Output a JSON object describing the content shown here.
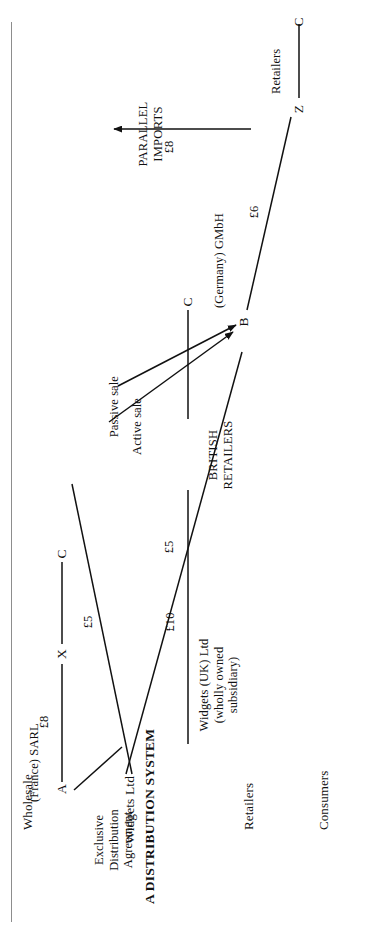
{
  "figure": {
    "title": "A DISTRIBUTION SYSTEM",
    "tiers": [
      {
        "id": "wholesale",
        "label": "Wholesale"
      },
      {
        "id": "retailers",
        "label": "Retailers"
      },
      {
        "id": "consumers",
        "label": "Consumers"
      }
    ],
    "nodes": [
      {
        "id": "A",
        "label": "A",
        "company": "(France) SARL",
        "tier": "wholesale"
      },
      {
        "id": "B",
        "label": "B",
        "company": "(Germany) GMbH",
        "tier": "wholesale"
      },
      {
        "id": "W",
        "label": "Widgets Ltd",
        "tier": "wholesale"
      },
      {
        "id": "X",
        "label": "X",
        "tier": "retailers"
      },
      {
        "id": "Z",
        "label": "Z",
        "company": "Retailers",
        "tier": "retailers"
      },
      {
        "id": "UK",
        "label": "Widgets (UK) Ltd\n(wholly owned\nsubsidiary)",
        "tier": "retailers"
      },
      {
        "id": "BR",
        "label": "BRITISH\nRETAILERS",
        "tier": "retailers"
      },
      {
        "id": "CA",
        "label": "C",
        "tier": "consumers"
      },
      {
        "id": "CB",
        "label": "C",
        "tier": "consumers"
      },
      {
        "id": "CC",
        "label": "C",
        "tier": "consumers"
      }
    ],
    "annotations": [
      {
        "id": "exclusive-agreement",
        "text": "Exclusive\nDistribution\nAgreement"
      },
      {
        "id": "passive-sale",
        "text": "Passive sale"
      },
      {
        "id": "active-sale",
        "text": "Active sale"
      },
      {
        "id": "parallel-imports",
        "text": "PARALLEL\nIMPORTS"
      }
    ],
    "prices": [
      {
        "id": "price-w-a",
        "text": "£5",
        "from": "Widgets Ltd",
        "to": "A (France) SARL"
      },
      {
        "id": "price-w-b",
        "text": "£5",
        "from": "Widgets Ltd",
        "to": "B (Germany) GMbH"
      },
      {
        "id": "price-a-x",
        "text": "£8",
        "from": "A (France) SARL",
        "to": "X"
      },
      {
        "id": "price-b-z",
        "text": "£6",
        "from": "B (Germany) GMbH",
        "to": "Z Retailers"
      },
      {
        "id": "price-uk-br",
        "text": "£10",
        "from": "Widgets (UK) Ltd",
        "to": "BRITISH RETAILERS"
      },
      {
        "id": "price-z-br",
        "text": "£8",
        "from": "Z Retailers",
        "to": "BRITISH RETAILERS"
      }
    ]
  }
}
